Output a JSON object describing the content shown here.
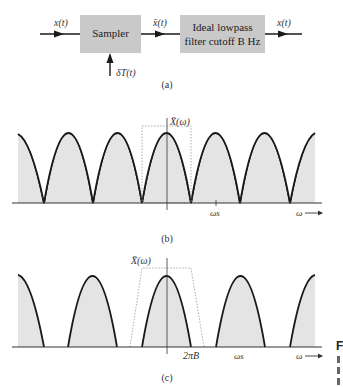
{
  "panel_a": {
    "input_label": "x(t)",
    "sampler_label": "Sampler",
    "sampled_label": "x̄(t)",
    "filter_label_line1": "Ideal lowpass",
    "filter_label_line2": "filter cutoff B Hz",
    "output_label": "x(t)",
    "impulse_label": "δT(t)",
    "caption": "(a)"
  },
  "panel_b": {
    "y_label": "X̄(ω)",
    "tick_label": "ωs",
    "x_label": "ω",
    "caption": "(b)"
  },
  "panel_c": {
    "y_label": "X̄(ω)",
    "tick_2piB": "2πB",
    "tick_ws": "ωs",
    "x_label": "ω",
    "caption": "(c)"
  },
  "side_text": {
    "fragment": "F"
  },
  "colors": {
    "block_fill": "#c9c9c9",
    "spectrum_fill": "#e4e4e4",
    "curve": "#1a1a1a",
    "filter_outline": "#999999"
  }
}
